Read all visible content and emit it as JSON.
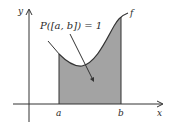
{
  "diagram": {
    "equation_label": "P([a, b]) = 1",
    "x_axis_label": "x",
    "y_axis_label": "y",
    "curve_label": "f",
    "interval_start_label": "a",
    "interval_end_label": "b",
    "colors": {
      "shading": "#9a9a9a",
      "stroke": "#333333"
    }
  }
}
